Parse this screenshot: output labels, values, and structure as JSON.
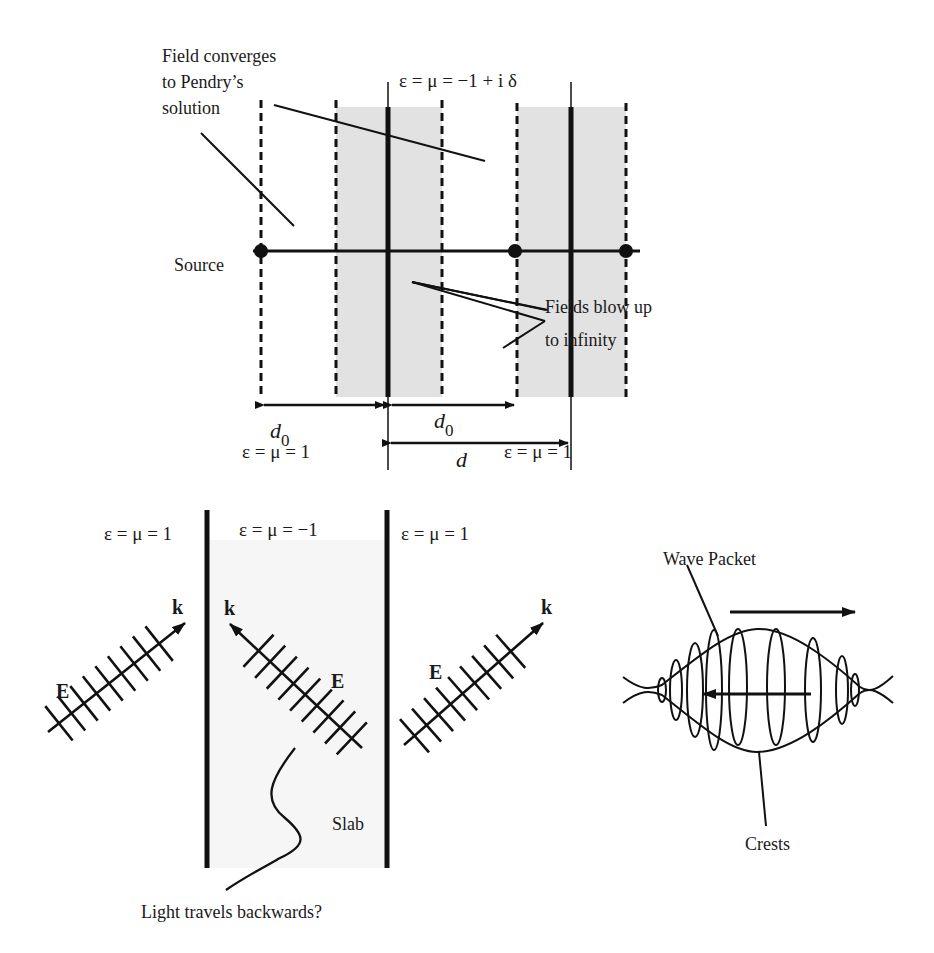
{
  "top_panel": {
    "annotation_converges": [
      "Field converges",
      "to Pendry’s",
      "solution"
    ],
    "slab_material": "ε = μ = −1 + i δ",
    "source_label": "Source",
    "annotation_blowup": [
      "Fields blow up",
      "to infinity"
    ],
    "d0_left": "d",
    "d0_left_sub": "0",
    "d0_right": "d",
    "d0_right_sub": "0",
    "d_label": "d",
    "vacuum_left": "ε = μ = 1",
    "vacuum_right": "ε = μ = 1",
    "shade_color": "#e2e2e2"
  },
  "bottom_left_panel": {
    "region_left": "ε = μ = 1",
    "region_middle": "ε = μ = −1",
    "region_right": "ε = μ = 1",
    "k_label": "k",
    "e_label": "E",
    "slab_label": "Slab",
    "caption": "Light travels backwards?",
    "slab_color": "#f6f6f6"
  },
  "bottom_right_panel": {
    "wave_packet_label": "Wave Packet",
    "crests_label": "Crests"
  }
}
